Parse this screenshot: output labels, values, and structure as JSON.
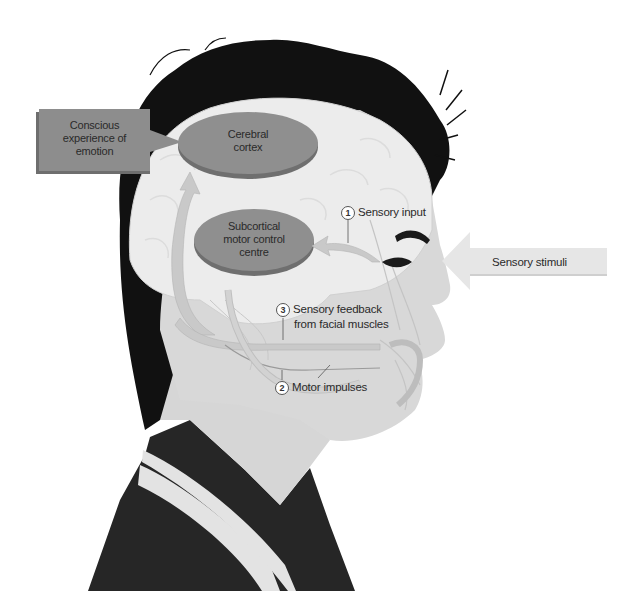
{
  "figure": {
    "colors": {
      "hair": "#111111",
      "brain": "#e8e8e8",
      "skin": "#d8d8d8",
      "shirt": "#262626",
      "stripe": "#e6e6e6",
      "oval": "#8f8f8f",
      "oval_edge": "#6f6f6f",
      "box": "#8d8d8d",
      "arrow": "#c9c9c9"
    }
  },
  "boxes": {
    "emotion_box": {
      "lines": [
        "Conscious",
        "experience of",
        "emotion"
      ]
    },
    "cerebral_cortex": {
      "lines": [
        "Cerebral",
        "cortex"
      ]
    },
    "subcortical": {
      "lines": [
        "Subcortical",
        "motor control",
        "centre"
      ]
    }
  },
  "stimulus_arrow": {
    "label": "Sensory stimuli"
  },
  "callouts": [
    {
      "number": "1",
      "lines": [
        "Sensory input"
      ]
    },
    {
      "number": "2",
      "lines": [
        "Motor impulses"
      ]
    },
    {
      "number": "3",
      "lines": [
        "Sensory feedback",
        "from facial muscles"
      ]
    }
  ]
}
